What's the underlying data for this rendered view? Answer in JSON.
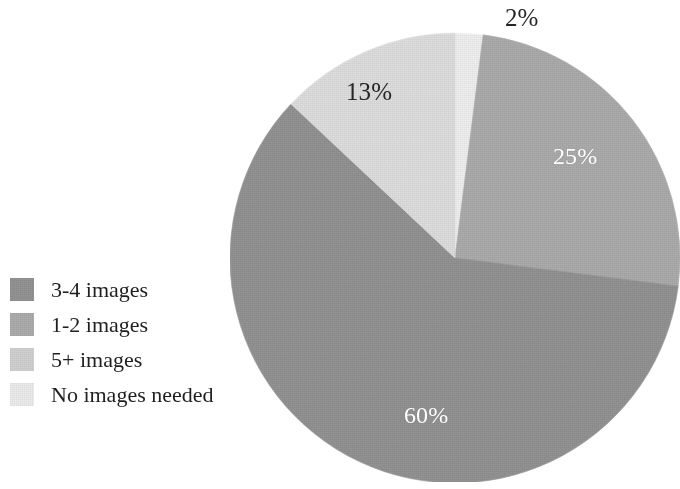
{
  "chart_data": {
    "type": "pie",
    "title": "",
    "subtitle": "",
    "xlabel": "",
    "ylabel": "",
    "grid": false,
    "legend_position": "left",
    "start_angle_deg": 0,
    "direction": "clockwise",
    "categories": [
      "No images needed",
      "1-2 images",
      "3-4 images",
      "5+ images"
    ],
    "values": [
      2,
      25,
      60,
      13
    ],
    "slices": [
      {
        "name": "No images needed",
        "value": 2,
        "data_label": "2%",
        "color": "#F2F2F2",
        "label_color": "#262626",
        "label_placement": "outside-top"
      },
      {
        "name": "1-2 images",
        "value": 25,
        "data_label": "25%",
        "color": "#ADADAD",
        "label_color": "#FFFFFF",
        "label_placement": "inside"
      },
      {
        "name": "3-4 images",
        "value": 60,
        "data_label": "60%",
        "color": "#949494",
        "label_color": "#FFFFFF",
        "label_placement": "inside"
      },
      {
        "name": "5+ images",
        "value": 13,
        "data_label": "13%",
        "color": "#E0E0E0",
        "label_color": "#262626",
        "label_placement": "inside"
      }
    ],
    "data_labels": [
      "2%",
      "25%",
      "60%",
      "13%"
    ]
  },
  "legend": {
    "items": [
      {
        "label": "3-4 images",
        "color": "#949494",
        "value": 60
      },
      {
        "label": "1-2 images",
        "color": "#ADADAD",
        "value": 25
      },
      {
        "label": "5+ images",
        "color": "#D2D2D2",
        "value": 13
      },
      {
        "label": "No images needed",
        "color": "#EDEDED",
        "value": 2
      }
    ]
  },
  "labels": {
    "two_percent": "2%",
    "thirteen_percent": "13%",
    "twenty_five_percent": "25%",
    "sixty_percent": "60%"
  },
  "colors": {
    "background": "#FFFFFF",
    "slice_darkest": "#949494",
    "slice_medium": "#ADADAD",
    "slice_light": "#E0E0E0",
    "slice_lightest": "#F2F2F2",
    "text_dark": "#262626",
    "text_light": "#FFFFFF"
  }
}
